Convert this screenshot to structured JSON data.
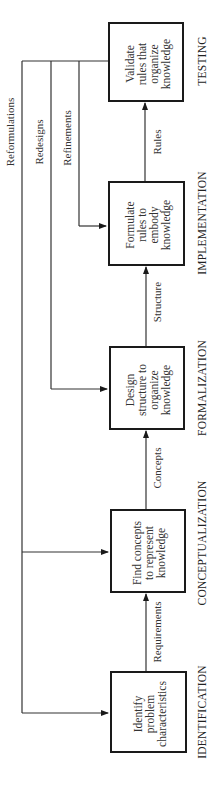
{
  "diagram": {
    "orientation": "rotated-90-ccw",
    "stages": [
      {
        "phase": "TESTING",
        "box_lines": [
          "Validate",
          "rules that",
          "organize",
          "knowledge"
        ]
      },
      {
        "phase": "IMPLEMENTATION",
        "box_lines": [
          "Formulate",
          "rules to",
          "embody",
          "knowledge"
        ]
      },
      {
        "phase": "FORMALIZATION",
        "box_lines": [
          "Design",
          "structure to",
          "organize",
          "knowledge"
        ]
      },
      {
        "phase": "CONCEPTUALIZATION",
        "box_lines": [
          "Find concepts",
          "to represent",
          "knowledge"
        ]
      },
      {
        "phase": "IDENTIFICATION",
        "box_lines": [
          "Identify",
          "problem",
          "characteristics"
        ]
      }
    ],
    "flow_labels": {
      "identification_to_conceptualization": "Requirements",
      "conceptualization_to_formalization": "Concepts",
      "formalization_to_implementation": "Structure",
      "implementation_to_testing": "Rules"
    },
    "feedback_labels": {
      "reformulations": "Reformulations",
      "redesigns": "Redesigns",
      "refinements": "Refinements"
    }
  }
}
